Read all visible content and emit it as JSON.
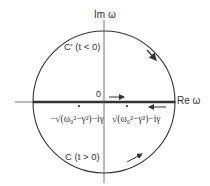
{
  "diagram": {
    "axes": {
      "imaginary_label": "Im ω",
      "real_label": "Re ω",
      "origin_label": "0"
    },
    "contours": {
      "upper_label": "C′ (t < 0)",
      "lower_label": "C (t > 0)"
    },
    "poles": {
      "left_label": "−√(ω₀²−γ²)−iγ",
      "right_label": "√(ω₀²−γ²)−iγ"
    },
    "colors": {
      "line": "#333333",
      "background": "#ffffff"
    }
  }
}
